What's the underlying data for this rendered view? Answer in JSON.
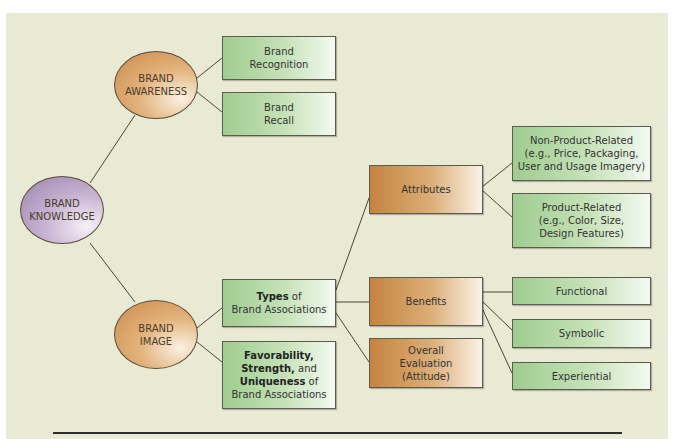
{
  "diagram": {
    "root": {
      "line1": "BRAND",
      "line2": "KNOWLEDGE"
    },
    "awareness": {
      "node": {
        "line1": "BRAND",
        "line2": "AWARENESS"
      },
      "children": [
        {
          "line1": "Brand",
          "line2": "Recognition"
        },
        {
          "line1": "Brand",
          "line2": "Recall"
        }
      ]
    },
    "image": {
      "node": {
        "line1": "BRAND",
        "line2": "IMAGE"
      },
      "types_box": {
        "bold": "Types",
        "rest": " of",
        "line2": "Brand Associations"
      },
      "favorability_box": {
        "bold1": "Favorability,",
        "bold2": "Strength,",
        "and": " and",
        "bold3": "Uniqueness",
        "of": " of",
        "line4": "Brand Associations"
      },
      "type_children": {
        "attributes": {
          "label": "Attributes",
          "children": [
            {
              "line1": "Non-Product-Related",
              "line2": "(e.g., Price, Packaging,",
              "line3": "User and Usage Imagery)"
            },
            {
              "line1": "Product-Related",
              "line2": "(e.g., Color, Size,",
              "line3": "Design Features)"
            }
          ]
        },
        "benefits": {
          "label": "Benefits",
          "children": [
            "Functional",
            "Symbolic",
            "Experiential"
          ]
        },
        "overall": {
          "line1": "Overall",
          "line2": "Evaluation",
          "line3": "(Attitude)"
        }
      }
    }
  },
  "colors": {
    "background": "#e9ead3",
    "orange_node": "#c98a48",
    "purple_node": "#9c82ad",
    "green_box": "#9fcc8f",
    "brown_box": "#c4843f"
  }
}
